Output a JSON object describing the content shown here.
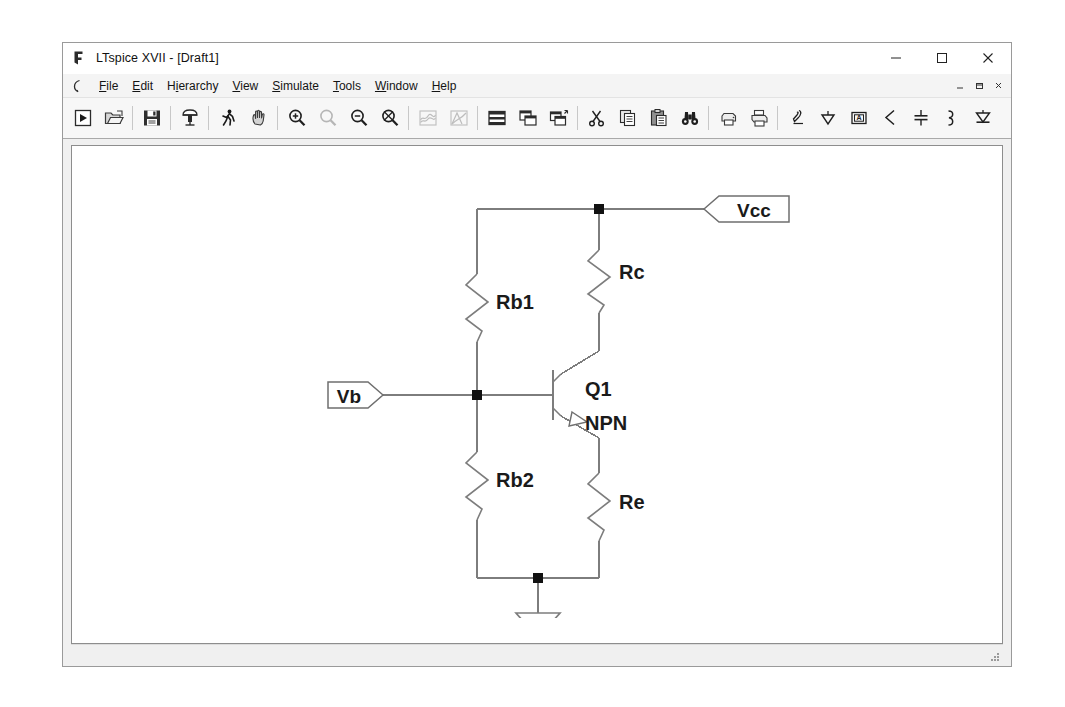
{
  "window": {
    "title": "LTspice XVII - [Draft1]",
    "app_icon": "ltspice-logo-icon",
    "controls": [
      {
        "name": "minimize-button",
        "glyph": "–"
      },
      {
        "name": "maximize-button",
        "glyph": "□"
      },
      {
        "name": "close-button",
        "glyph": "✕"
      }
    ],
    "mdi_controls": [
      {
        "name": "mdi-minimize-button",
        "glyph": "_"
      },
      {
        "name": "mdi-restore-button",
        "glyph": "⧉"
      },
      {
        "name": "mdi-close-button",
        "glyph": "×"
      }
    ]
  },
  "menubar": {
    "system_icon": "ltspice-small-icon",
    "items": [
      {
        "label": "File",
        "accel": "F"
      },
      {
        "label": "Edit",
        "accel": "E"
      },
      {
        "label": "Hierarchy",
        "accel": "i"
      },
      {
        "label": "View",
        "accel": "V"
      },
      {
        "label": "Simulate",
        "accel": "S"
      },
      {
        "label": "Tools",
        "accel": "T"
      },
      {
        "label": "Window",
        "accel": "W"
      },
      {
        "label": "Help",
        "accel": "H"
      }
    ]
  },
  "toolbar": {
    "groups": [
      [
        "new-schematic-icon",
        "open-file-icon"
      ],
      [
        "save-file-icon"
      ],
      [
        "hierarchy-icon"
      ],
      [
        "run-simulation-icon",
        "pan-hand-icon"
      ],
      [
        "zoom-in-icon",
        "zoom-area-icon",
        "zoom-out-icon",
        "zoom-fit-icon"
      ],
      [
        "waveform-view-icon",
        "waveform-area-icon"
      ],
      [
        "tile-horizontal-icon",
        "tile-vertical-icon",
        "cascade-icon"
      ],
      [
        "cut-scissors-icon",
        "copy-icon",
        "paste-icon",
        "find-binoculars-icon"
      ],
      [
        "print-preview-icon",
        "print-icon"
      ],
      [
        "draw-wire-pencil-icon",
        "place-ground-icon",
        "place-label-icon",
        "place-resistor-icon",
        "place-capacitor-icon",
        "place-inductor-icon",
        "place-diode-icon"
      ]
    ],
    "disabled": [
      "zoom-area-icon",
      "waveform-view-icon",
      "waveform-area-icon"
    ]
  },
  "statusbar": {
    "text": ""
  },
  "schematic": {
    "title": "Draft1",
    "wire_color": "#7d7d7d",
    "symbol_color": "#6f6f6f",
    "text_color": "#1a1a1a",
    "node_color": "#111111",
    "labels": {
      "rb1": "Rb1",
      "rb2": "Rb2",
      "rc": "Rc",
      "re": "Re",
      "q1": "Q1",
      "q1_model": "NPN"
    },
    "ports": [
      {
        "name": "vcc-net-flag",
        "text": "Vcc",
        "direction": "left"
      },
      {
        "name": "vb-net-flag",
        "text": "Vb",
        "direction": "right"
      }
    ],
    "components": [
      {
        "ref": "Rb1",
        "type": "resistor"
      },
      {
        "ref": "Rb2",
        "type": "resistor"
      },
      {
        "ref": "Rc",
        "type": "resistor"
      },
      {
        "ref": "Re",
        "type": "resistor"
      },
      {
        "ref": "Q1",
        "type": "npn-transistor",
        "model": "NPN"
      }
    ],
    "ground_symbol": "ground-triangle-icon",
    "junction_count": 3
  }
}
